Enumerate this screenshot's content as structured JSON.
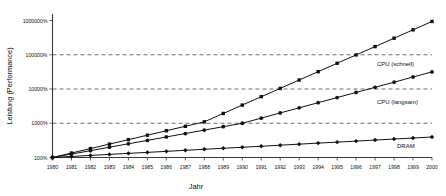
{
  "chart_data": {
    "type": "line",
    "title": "",
    "xlabel": "Jahr",
    "ylabel": "Leistung (Performance)",
    "yscale": "log",
    "ylim": [
      100,
      1000000
    ],
    "xlim": [
      1980,
      2000
    ],
    "grid": true,
    "legend_position": "right-inline",
    "y_tick_labels": [
      "1000000%",
      "100000%",
      "10000%",
      "1000%",
      "100%"
    ],
    "y_tick_values": [
      1000000,
      100000,
      10000,
      1000,
      100
    ],
    "gridline_values": [
      100000,
      10000,
      1000
    ],
    "x_tick_labels": [
      "1980",
      "1981",
      "1982",
      "1983",
      "1984",
      "1985",
      "1986",
      "1987",
      "1988",
      "1989",
      "1990",
      "1991",
      "1992",
      "1993",
      "1994",
      "1995",
      "1996",
      "1997",
      "1998",
      "1999",
      "2000"
    ],
    "x": [
      1980,
      1981,
      1982,
      1983,
      1984,
      1985,
      1986,
      1987,
      1988,
      1989,
      1990,
      1991,
      1992,
      1993,
      1994,
      1995,
      1996,
      1997,
      1998,
      1999,
      2000
    ],
    "series": [
      {
        "name": "CPU (schnell)",
        "marker": "square",
        "values": [
          100,
          135,
          182,
          246,
          332,
          448,
          605,
          816,
          1100,
          1930,
          3390,
          5950,
          10400,
          18300,
          32100,
          56400,
          99000,
          173000,
          304000,
          534000,
          938000
        ]
      },
      {
        "name": "CPU (langsam)",
        "marker": "circle",
        "values": [
          100,
          126,
          158,
          200,
          251,
          316,
          398,
          501,
          631,
          794,
          1000,
          1410,
          2000,
          2820,
          3980,
          5620,
          7940,
          11200,
          15800,
          22400,
          31600
        ]
      },
      {
        "name": "DRAM",
        "marker": "diamond",
        "values": [
          100,
          107,
          115,
          123,
          132,
          141,
          151,
          162,
          174,
          186,
          199,
          213,
          229,
          245,
          263,
          281,
          301,
          323,
          346,
          370,
          397
        ]
      }
    ]
  },
  "axes": {
    "x_title": "Jahr",
    "y_title": "Leistung (Performance)"
  },
  "colors": {
    "line": "#111111",
    "axis": "#3a3a3a",
    "grid": "#4a4a4a",
    "background": "#ffffff"
  }
}
